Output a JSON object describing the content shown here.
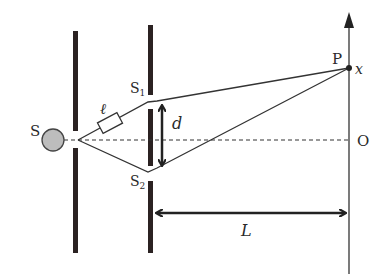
{
  "diagram": {
    "labels": {
      "source": "S",
      "slit1": "S",
      "slit1_sub": "1",
      "slit2": "S",
      "slit2_sub": "2",
      "filter": "ℓ",
      "separation": "d",
      "distance": "L",
      "point": "P",
      "coordinate": "x",
      "origin": "O"
    },
    "colors": {
      "barrier": "#2b2222",
      "line": "#333333",
      "source_fill": "#bdbdbd",
      "source_stroke": "#444444"
    },
    "geometry": {
      "source_center": [
        53,
        140
      ],
      "source_radius": 11,
      "source_slit_point": [
        78,
        140
      ],
      "slit1_point": [
        155,
        101
      ],
      "slit2_point": [
        155,
        170
      ],
      "screen_x": 349,
      "point_p": [
        349,
        68
      ],
      "axis_level_y": 140
    }
  }
}
